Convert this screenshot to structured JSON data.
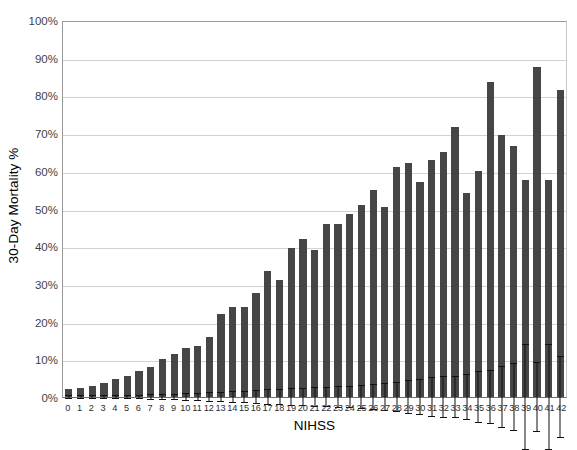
{
  "chart_data": {
    "type": "bar",
    "title": "",
    "xlabel": "NIHSS",
    "ylabel": "30-Day Mortality %",
    "ylim": [
      0,
      100
    ],
    "ytick_labels": [
      "0%",
      "10%",
      "20%",
      "30%",
      "40%",
      "50%",
      "60%",
      "70%",
      "80%",
      "90%",
      "100%"
    ],
    "ytick_values": [
      0,
      10,
      20,
      30,
      40,
      50,
      60,
      70,
      80,
      90,
      100
    ],
    "grid": "horizontal",
    "legend": "none",
    "bar_color": "#464646",
    "error_bar_color": "#111111",
    "categories": [
      "0",
      "1",
      "2",
      "3",
      "4",
      "5",
      "6",
      "7",
      "8",
      "9",
      "10",
      "11",
      "12",
      "13",
      "14",
      "15",
      "16",
      "17",
      "18",
      "19",
      "20",
      "21",
      "22",
      "23",
      "24",
      "25",
      "26",
      "27",
      "28",
      "29",
      "30",
      "31",
      "32",
      "33",
      "34",
      "35",
      "36",
      "37",
      "38",
      "39",
      "40",
      "41",
      "42"
    ],
    "values": [
      2.0,
      2.3,
      2.8,
      3.8,
      4.7,
      5.5,
      7.0,
      8.0,
      10.0,
      11.5,
      13.0,
      13.5,
      16.0,
      22.0,
      24.0,
      24.0,
      27.5,
      33.5,
      31.0,
      39.5,
      42.0,
      39.0,
      46.0,
      46.0,
      48.5,
      51.0,
      55.0,
      50.5,
      61.0,
      62.0,
      57.0,
      63.0,
      65.0,
      71.5,
      54.0,
      60.0,
      83.5,
      69.5,
      66.5,
      57.5,
      87.5,
      57.5,
      81.5
    ],
    "err_low": [
      1.6,
      1.9,
      2.4,
      3.3,
      4.1,
      4.9,
      6.4,
      7.3,
      9.2,
      10.6,
      12.0,
      12.4,
      14.8,
      20.6,
      22.4,
      22.3,
      25.6,
      31.3,
      28.8,
      37.2,
      39.5,
      36.3,
      43.3,
      43.2,
      45.6,
      47.8,
      51.5,
      46.9,
      57.0,
      57.5,
      52.2,
      57.8,
      59.4,
      65.8,
      47.8,
      53.0,
      76.3,
      61.2,
      57.4,
      43.5,
      78.3,
      43.5,
      70.5
    ],
    "err_high": [
      2.4,
      2.7,
      3.2,
      4.3,
      5.3,
      6.1,
      7.6,
      8.7,
      10.8,
      12.4,
      14.0,
      14.6,
      17.2,
      23.4,
      25.6,
      25.7,
      29.4,
      35.7,
      33.2,
      41.8,
      44.5,
      41.7,
      48.7,
      48.8,
      51.4,
      54.2,
      58.5,
      54.1,
      65.0,
      66.5,
      61.8,
      68.2,
      70.6,
      77.2,
      60.2,
      67.0,
      90.7,
      77.8,
      75.6,
      71.5,
      96.7,
      71.5,
      92.5
    ]
  }
}
